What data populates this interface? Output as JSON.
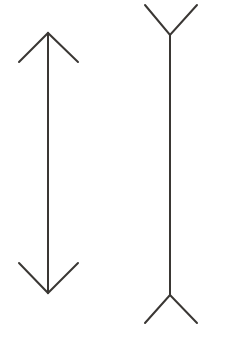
{
  "document": {
    "title": "Muller-Lyer Illusion",
    "background_color": "#ffffff",
    "width": 225,
    "height": 341,
    "description": "Two vertical line figures of equal shaft length: the left has inward-pointing arrowheads (fins in) at both ends, the right has outward-pointing fins (fins out) at both ends."
  },
  "style": {
    "line_color": "#3a3734",
    "line_width": 2
  },
  "chart_data": {
    "type": "line",
    "xlabel": "",
    "ylabel": "",
    "xlim": [
      0,
      225
    ],
    "ylim": [
      341,
      0
    ],
    "grid": false,
    "legend": "none",
    "series": [
      {
        "name": "left-figure-shaft",
        "x": [
          48,
          48
        ],
        "y": [
          33,
          293
        ]
      },
      {
        "name": "left-figure-top-fin-left",
        "x": [
          48,
          19
        ],
        "y": [
          33,
          62
        ]
      },
      {
        "name": "left-figure-top-fin-right",
        "x": [
          48,
          78
        ],
        "y": [
          33,
          62
        ]
      },
      {
        "name": "left-figure-bottom-fin-left",
        "x": [
          48,
          19
        ],
        "y": [
          293,
          263
        ]
      },
      {
        "name": "left-figure-bottom-fin-right",
        "x": [
          48,
          78
        ],
        "y": [
          293,
          263
        ]
      },
      {
        "name": "right-figure-shaft",
        "x": [
          170,
          170
        ],
        "y": [
          35,
          295
        ]
      },
      {
        "name": "right-figure-top-fin-left",
        "x": [
          170,
          145
        ],
        "y": [
          35,
          5
        ]
      },
      {
        "name": "right-figure-top-fin-right",
        "x": [
          170,
          197
        ],
        "y": [
          35,
          5
        ]
      },
      {
        "name": "right-figure-bottom-fin-left",
        "x": [
          170,
          145
        ],
        "y": [
          295,
          323
        ]
      },
      {
        "name": "right-figure-bottom-fin-right",
        "x": [
          170,
          197
        ],
        "y": [
          295,
          323
        ]
      }
    ]
  },
  "figures": {
    "left": {
      "label": "fins-in-figure",
      "shaft": {
        "x1": 48,
        "y1": 33,
        "x2": 48,
        "y2": 293,
        "length": 260
      },
      "top_fins": "M 19 62 L 48 33 L 78 62",
      "bottom_fins": "M 19 263 L 48 293 L 78 263"
    },
    "right": {
      "label": "fins-out-figure",
      "shaft": {
        "x1": 170,
        "y1": 35,
        "x2": 170,
        "y2": 295,
        "length": 260
      },
      "top_fins": "M 145 5 L 170 35 L 197 5",
      "bottom_fins": "M 145 323 L 170 295 L 197 323"
    }
  }
}
